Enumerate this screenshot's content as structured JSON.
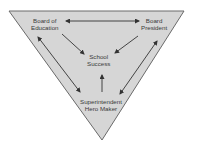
{
  "diagram": {
    "type": "inverted-triangle relationship diagram",
    "colors": {
      "triangle_fill": "#d6d6d6",
      "triangle_stroke": "#6a6a6a",
      "arrow": "#333333",
      "text": "#3a3a3a"
    },
    "nodes": {
      "board_of_education": {
        "line1": "Board of",
        "line2": "Education"
      },
      "board_president": {
        "line1": "Board",
        "line2": "President"
      },
      "school_success": {
        "line1": "School",
        "line2": "Success"
      },
      "superintendent": {
        "line1": "Superintendent",
        "line2": "Hero Maker"
      }
    },
    "edges": [
      {
        "from": "Board of Education",
        "to": "Board President",
        "direction": "both"
      },
      {
        "from": "Board of Education",
        "to": "School Success",
        "direction": "forward"
      },
      {
        "from": "Board President",
        "to": "School Success",
        "direction": "forward"
      },
      {
        "from": "Board of Education",
        "to": "Superintendent Hero Maker",
        "direction": "both"
      },
      {
        "from": "Board President",
        "to": "Superintendent Hero Maker",
        "direction": "both"
      },
      {
        "from": "Superintendent Hero Maker",
        "to": "School Success",
        "direction": "forward"
      }
    ]
  }
}
